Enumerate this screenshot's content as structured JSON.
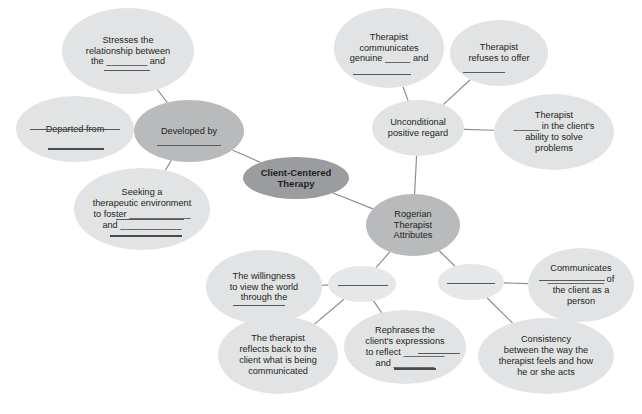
{
  "diagram": {
    "colors": {
      "leaf_fill": "#e2e3e4",
      "branch_fill": "#b9babc",
      "center_fill": "#9b9c9f",
      "text": "#231f20",
      "edge": "#8c8d8f",
      "rule": "#58595b",
      "background": "#ffffff"
    },
    "nodes": [
      {
        "id": "stresses-relationship",
        "label": "Stresses the\nrelationship between\nthe ________ and",
        "tone": "leaf",
        "x": 62,
        "y": 8,
        "w": 132,
        "h": 86
      },
      {
        "id": "departed-from",
        "label": "Departed from",
        "tone": "leaf",
        "x": 16,
        "y": 96,
        "w": 118,
        "h": 66
      },
      {
        "id": "developed-by",
        "label": "Developed by",
        "tone": "branch",
        "x": 134,
        "y": 100,
        "w": 110,
        "h": 62
      },
      {
        "id": "seeking-therapeutic-environment",
        "label": "Seeking a\ntherapeutic environment\nto foster ____________\nand ____________",
        "tone": "leaf",
        "x": 74,
        "y": 168,
        "w": 136,
        "h": 82
      },
      {
        "id": "client-centered-therapy",
        "label": "Client-Centered\nTherapy",
        "tone": "center",
        "x": 243,
        "y": 157,
        "w": 106,
        "h": 42,
        "bold": true
      },
      {
        "id": "therapist-communicates-genuine",
        "label": "Therapist\ncommunicates\ngenuine _____ and",
        "tone": "leaf",
        "x": 334,
        "y": 8,
        "w": 110,
        "h": 80
      },
      {
        "id": "therapist-refuses-to-offer",
        "label": "Therapist\nrefuses to offer",
        "tone": "leaf",
        "x": 450,
        "y": 20,
        "w": 98,
        "h": 66
      },
      {
        "id": "unconditional-positive-regard",
        "label": "Unconditional\npositive regard",
        "tone": "leaf",
        "x": 372,
        "y": 100,
        "w": 92,
        "h": 56
      },
      {
        "id": "therapist-believes-ability",
        "label": "Therapist\n_____ in the client's\nability to solve\nproblems",
        "tone": "leaf",
        "x": 494,
        "y": 94,
        "w": 120,
        "h": 76
      },
      {
        "id": "rogerian-therapist-attributes",
        "label": "Rogerian\nTherapist\nAttributes",
        "tone": "branch",
        "x": 366,
        "y": 194,
        "w": 94,
        "h": 62
      },
      {
        "id": "willingness-view-world",
        "label": "The willingness\nto view the world\nthrough the",
        "tone": "leaf",
        "x": 206,
        "y": 250,
        "w": 116,
        "h": 74
      },
      {
        "id": "blank-connector-left",
        "label": "",
        "tone": "blank",
        "x": 328,
        "y": 266,
        "w": 68,
        "h": 36
      },
      {
        "id": "blank-connector-right",
        "label": "",
        "tone": "blank",
        "x": 438,
        "y": 264,
        "w": 66,
        "h": 36
      },
      {
        "id": "communicates-of-client",
        "label": "Communicates\n___________ of\nthe client as a\nperson",
        "tone": "leaf",
        "x": 528,
        "y": 248,
        "w": 106,
        "h": 74
      },
      {
        "id": "therapist-reflects-back",
        "label": "The therapist\nreflects back to the\nclient what is being\ncommunicated",
        "tone": "leaf",
        "x": 218,
        "y": 316,
        "w": 120,
        "h": 78
      },
      {
        "id": "rephrases-client-expressions",
        "label": "Rephrases the\nclient's expressions\nto reflect ________\nand ________",
        "tone": "leaf",
        "x": 344,
        "y": 310,
        "w": 122,
        "h": 74
      },
      {
        "id": "consistency-therapist-feels",
        "label": "Consistency\nbetween the way the\ntherapist feels and how\nhe or she acts",
        "tone": "leaf",
        "x": 478,
        "y": 318,
        "w": 136,
        "h": 76
      }
    ],
    "edges": [
      {
        "from": "stresses-relationship",
        "to": "developed-by"
      },
      {
        "from": "departed-from",
        "to": "developed-by"
      },
      {
        "from": "seeking-therapeutic-environment",
        "to": "developed-by"
      },
      {
        "from": "developed-by",
        "to": "client-centered-therapy"
      },
      {
        "from": "client-centered-therapy",
        "to": "rogerian-therapist-attributes"
      },
      {
        "from": "therapist-communicates-genuine",
        "to": "unconditional-positive-regard"
      },
      {
        "from": "therapist-refuses-to-offer",
        "to": "unconditional-positive-regard"
      },
      {
        "from": "therapist-believes-ability",
        "to": "unconditional-positive-regard"
      },
      {
        "from": "unconditional-positive-regard",
        "to": "rogerian-therapist-attributes"
      },
      {
        "from": "rogerian-therapist-attributes",
        "to": "blank-connector-left"
      },
      {
        "from": "rogerian-therapist-attributes",
        "to": "blank-connector-right"
      },
      {
        "from": "willingness-view-world",
        "to": "blank-connector-left"
      },
      {
        "from": "blank-connector-left",
        "to": "therapist-reflects-back"
      },
      {
        "from": "blank-connector-left",
        "to": "rephrases-client-expressions"
      },
      {
        "from": "blank-connector-right",
        "to": "communicates-of-client"
      },
      {
        "from": "blank-connector-right",
        "to": "consistency-therapist-feels"
      }
    ],
    "answer_rules": [
      {
        "node": "stresses-relationship",
        "x": 104,
        "y": 70,
        "w": 46
      },
      {
        "node": "departed-from",
        "x": 30,
        "y": 129,
        "w": 90
      },
      {
        "node": "departed-from",
        "x": 48,
        "y": 148,
        "w": 56,
        "thick": true
      },
      {
        "node": "developed-by",
        "x": 157,
        "y": 145,
        "w": 64
      },
      {
        "node": "seeking-therapeutic-environment",
        "x": 116,
        "y": 219,
        "w": 68
      },
      {
        "node": "seeking-therapeutic-environment",
        "x": 110,
        "y": 235,
        "w": 72,
        "thick": true
      },
      {
        "node": "therapist-communicates-genuine",
        "x": 353,
        "y": 74,
        "w": 58
      },
      {
        "node": "therapist-refuses-to-offer",
        "x": 463,
        "y": 72,
        "w": 42
      },
      {
        "node": "willingness-view-world",
        "x": 233,
        "y": 305,
        "w": 52
      },
      {
        "node": "blank-connector-left",
        "x": 338,
        "y": 285,
        "w": 50
      },
      {
        "node": "blank-connector-right",
        "x": 447,
        "y": 283,
        "w": 48
      },
      {
        "node": "communicates-of-client",
        "x": 539,
        "y": 280,
        "w": 66
      },
      {
        "node": "rephrases-client-expressions",
        "x": 418,
        "y": 353,
        "w": 42
      },
      {
        "node": "rephrases-client-expressions",
        "x": 394,
        "y": 368,
        "w": 42,
        "thick": true
      }
    ]
  }
}
